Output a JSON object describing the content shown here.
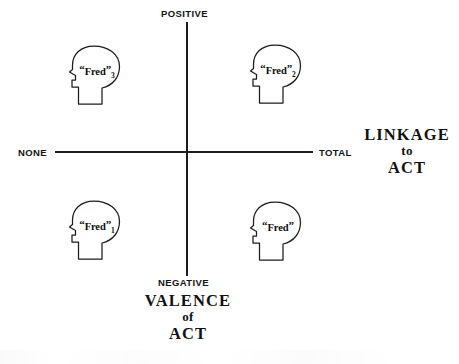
{
  "figure": {
    "type": "quadrant-diagram",
    "background": "#ffffff",
    "stroke_color": "#1c1c1c"
  },
  "axes": {
    "vertical": {
      "name": "VALENCE of ACT",
      "top_label": "POSITIVE",
      "bottom_label": "NEGATIVE",
      "title_line1": "VALENCE",
      "title_line2": "of",
      "title_line3": "ACT"
    },
    "horizontal": {
      "name": "LINKAGE to ACT",
      "left_label": "NONE",
      "right_label": "TOTAL",
      "title_line1": "LINKAGE",
      "title_line2": "to",
      "title_line3": "ACT"
    }
  },
  "markers": [
    {
      "id": "fred3",
      "label": "“Fred”",
      "name": "Fred",
      "subscript": "3",
      "quadrant": "upper-left",
      "valence": "POSITIVE",
      "linkage": "NONE",
      "icon": "head-profile-icon"
    },
    {
      "id": "fred2",
      "label": "“Fred”",
      "name": "Fred",
      "subscript": "2",
      "quadrant": "upper-right",
      "valence": "POSITIVE",
      "linkage": "TOTAL",
      "icon": "head-profile-icon"
    },
    {
      "id": "fred1",
      "label": "“Fred”",
      "name": "Fred",
      "subscript": "1",
      "quadrant": "lower-left",
      "valence": "NEGATIVE",
      "linkage": "NONE",
      "icon": "head-profile-icon"
    },
    {
      "id": "fred0",
      "label": "“Fred”",
      "name": "Fred",
      "subscript": "",
      "quadrant": "lower-right",
      "valence": "NEGATIVE",
      "linkage": "TOTAL",
      "icon": "head-profile-icon"
    }
  ]
}
